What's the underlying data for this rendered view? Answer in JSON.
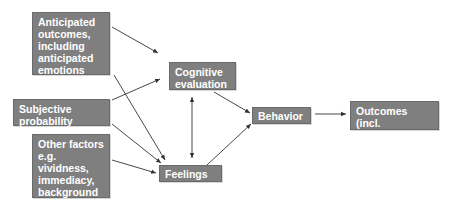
{
  "diagram": {
    "nodes": {
      "anticipated": {
        "label": "Anticipated outcomes, including anticipated emotions"
      },
      "subjective": {
        "label": "Subjective probability"
      },
      "other": {
        "label": "Other factors e.g. vividness, immediacy, background mood"
      },
      "cognitive": {
        "label": "Cognitive evaluation"
      },
      "feelings": {
        "label": "Feelings"
      },
      "behavior": {
        "label": "Behavior"
      },
      "outcomes": {
        "label": "Outcomes (incl. emotions)"
      }
    },
    "edges": [
      {
        "from": "anticipated",
        "to": "cognitive"
      },
      {
        "from": "anticipated",
        "to": "feelings"
      },
      {
        "from": "subjective",
        "to": "cognitive"
      },
      {
        "from": "subjective",
        "to": "feelings"
      },
      {
        "from": "other",
        "to": "feelings"
      },
      {
        "from": "cognitive",
        "to": "feelings",
        "bidirectional": true
      },
      {
        "from": "cognitive",
        "to": "behavior"
      },
      {
        "from": "feelings",
        "to": "behavior"
      },
      {
        "from": "behavior",
        "to": "outcomes"
      }
    ],
    "colors": {
      "box_fill": "#7f7f7f",
      "box_text": "#ffffff",
      "line": "#333333"
    }
  }
}
